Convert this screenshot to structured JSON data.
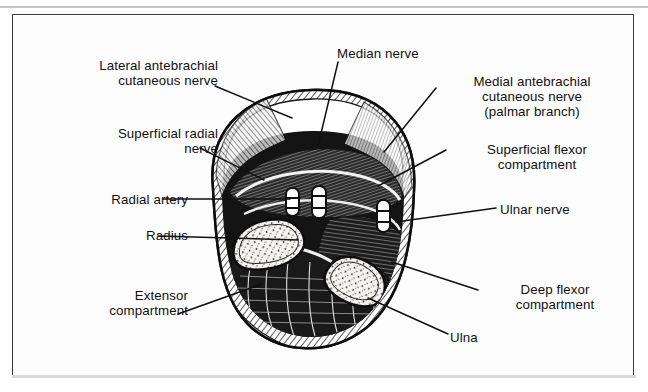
{
  "figure": {
    "kind": "anatomical-cross-section",
    "region": "forearm cross-section",
    "frame_color": "#3a3a3a",
    "background_color": "#ffffff",
    "ink_color": "#101010"
  },
  "labels": [
    {
      "id": "lateral-antebrachial-cutaneous-nerve",
      "text": "Lateral antebrachial\ncutaneous nerve",
      "align": "right",
      "x": 28,
      "y": 58,
      "w": 190
    },
    {
      "id": "superficial-radial-nerve",
      "text": "Superficial radial\nnerve",
      "align": "right",
      "x": 28,
      "y": 126,
      "w": 190
    },
    {
      "id": "radial-artery",
      "text": "Radial artery",
      "align": "right",
      "x": 28,
      "y": 192,
      "w": 160
    },
    {
      "id": "radius",
      "text": "Radius",
      "align": "right",
      "x": 28,
      "y": 228,
      "w": 160
    },
    {
      "id": "extensor-compartment",
      "text": "Extensor\ncompartment",
      "align": "right",
      "x": 28,
      "y": 288,
      "w": 160
    },
    {
      "id": "median-nerve",
      "text": "Median nerve",
      "align": "left",
      "x": 337,
      "y": 46,
      "w": 140
    },
    {
      "id": "medial-antebrachial-cutaneous-nerve",
      "text": "Medial antebrachial\ncutaneous nerve\n(palmar branch)",
      "align": "center",
      "x": 437,
      "y": 74,
      "w": 190
    },
    {
      "id": "superficial-flexor-compartment",
      "text": "Superficial flexor\ncompartment",
      "align": "center",
      "x": 447,
      "y": 142,
      "w": 180
    },
    {
      "id": "ulnar-nerve",
      "text": "Ulnar nerve",
      "align": "left",
      "x": 500,
      "y": 202,
      "w": 140
    },
    {
      "id": "deep-flexor-compartment",
      "text": "Deep flexor\ncompartment",
      "align": "center",
      "x": 480,
      "y": 282,
      "w": 150
    },
    {
      "id": "ulna",
      "text": "Ulna",
      "align": "left",
      "x": 450,
      "y": 330,
      "w": 90
    }
  ],
  "leader_lines": [
    {
      "id": "leader-lateral-antebrachial-cutaneous-nerve",
      "x1": 215,
      "y1": 86,
      "x2": 292,
      "y2": 118
    },
    {
      "id": "leader-superficial-radial-nerve",
      "x1": 200,
      "y1": 148,
      "x2": 264,
      "y2": 180
    },
    {
      "id": "leader-radial-artery",
      "x1": 163,
      "y1": 199,
      "x2": 290,
      "y2": 199
    },
    {
      "id": "leader-radius",
      "x1": 158,
      "y1": 236,
      "x2": 298,
      "y2": 240
    },
    {
      "id": "leader-extensor-compartment",
      "x1": 178,
      "y1": 314,
      "x2": 262,
      "y2": 284
    },
    {
      "id": "leader-median-nerve",
      "x1": 338,
      "y1": 62,
      "x2": 318,
      "y2": 146
    },
    {
      "id": "leader-medial-antebrachial-cutaneous-nerve",
      "x1": 436,
      "y1": 88,
      "x2": 384,
      "y2": 152
    },
    {
      "id": "leader-superficial-flexor-compartment",
      "x1": 446,
      "y1": 150,
      "x2": 378,
      "y2": 186
    },
    {
      "id": "leader-ulnar-nerve",
      "x1": 496,
      "y1": 208,
      "x2": 396,
      "y2": 222
    },
    {
      "id": "leader-deep-flexor-compartment",
      "x1": 478,
      "y1": 290,
      "x2": 392,
      "y2": 262
    },
    {
      "id": "leader-ulna",
      "x1": 448,
      "y1": 334,
      "x2": 368,
      "y2": 298
    }
  ],
  "illustration": {
    "description": "Hatched and stippled woodcut-style transverse section of the forearm showing radius and ulna, flexor and extensor muscle compartments, neurovascular bundles.",
    "bounds": {
      "x": 198,
      "y": 82,
      "w": 228,
      "h": 262
    },
    "bones": [
      {
        "id": "radius-bone",
        "cx": 268,
        "cy": 244,
        "rx": 34,
        "ry": 25,
        "rot": -14
      },
      {
        "id": "ulna-bone",
        "cx": 355,
        "cy": 281,
        "rx": 29,
        "ry": 24,
        "rot": 22
      }
    ]
  }
}
